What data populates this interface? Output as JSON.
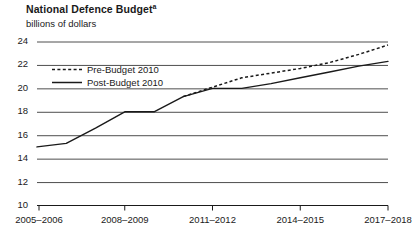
{
  "title": {
    "text": "National Defence Budget",
    "footnote_marker": "a"
  },
  "subtitle": "billions of dollars",
  "legend": {
    "items": [
      {
        "label": "Pre-Budget 2010",
        "style": "dashed",
        "color": "#1a1a1a"
      },
      {
        "label": "Post-Budget 2010",
        "style": "solid",
        "color": "#1a1a1a"
      }
    ]
  },
  "axes": {
    "y_ticks": [
      "24",
      "22",
      "20",
      "18",
      "16",
      "14",
      "12",
      "10"
    ],
    "x_ticks": [
      "2005–2006",
      "2008–2009",
      "2011–2012",
      "2014–2015",
      "2017–2018"
    ]
  },
  "chart_data": {
    "type": "line",
    "title": "National Defence Budget",
    "subtitle": "billions of dollars",
    "xlabel": "",
    "ylabel": "billions of dollars",
    "ylim": [
      10,
      24
    ],
    "ytick_values": [
      10,
      12,
      14,
      16,
      18,
      20,
      22,
      24
    ],
    "grid": "horizontal",
    "legend_position": "upper-left-inside",
    "categories": [
      "2005–2006",
      "2006–2007",
      "2007–2008",
      "2008–2009",
      "2009–2010",
      "2010–2011",
      "2011–2012",
      "2012–2013",
      "2013–2014",
      "2014–2015",
      "2015–2016",
      "2016–2017",
      "2017–2018"
    ],
    "labelled_categories": [
      "2005–2006",
      "2008–2009",
      "2011–2012",
      "2014–2015",
      "2017–2018"
    ],
    "series": [
      {
        "name": "Post-Budget 2010",
        "style": "solid",
        "color": "#1a1a1a",
        "values": [
          15.0,
          15.3,
          16.6,
          18.0,
          18.0,
          19.3,
          20.0,
          20.0,
          20.4,
          20.9,
          21.4,
          21.9,
          22.3
        ]
      },
      {
        "name": "Pre-Budget 2010",
        "style": "dashed",
        "color": "#1a1a1a",
        "values": [
          null,
          null,
          null,
          null,
          null,
          19.3,
          20.1,
          20.9,
          21.3,
          21.7,
          22.2,
          22.9,
          23.7
        ]
      }
    ]
  }
}
